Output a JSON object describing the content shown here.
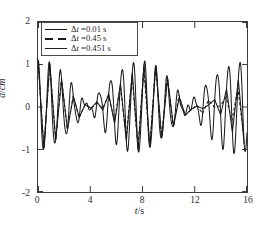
{
  "chart_data": {
    "type": "line",
    "title": "",
    "xlabel": "t/s",
    "ylabel": "d/cm",
    "xlim": [
      0,
      16
    ],
    "ylim": [
      -2,
      2
    ],
    "xticks": [
      "0",
      "4",
      "8",
      "12",
      "16"
    ],
    "xtick_values": [
      0,
      4,
      8,
      12,
      16
    ],
    "yticks": [
      "2",
      "1",
      "0",
      "-1",
      "-2"
    ],
    "ytick_values": [
      2,
      1,
      0,
      -1,
      -2
    ],
    "grid": false,
    "legend_position": "top-left",
    "series": [
      {
        "name": "Δt =0.01 s",
        "linestyle": "solid",
        "color": "#1a1a1a",
        "description": "Beating displacement signal, amplitude envelope ~1 cm, carrier period ~0.9 s"
      },
      {
        "name": "Δt =0.45 s",
        "linestyle": "dashed",
        "color": "#1a1a1a",
        "description": "Same signal sampled at 0.45 s, aliased waveform with slight phase shift"
      },
      {
        "name": "Δt =0.451 s",
        "linestyle": "solid",
        "color": "#1a1a1a",
        "description": "Same signal sampled at 0.451 s, aliased waveform nearly overlapping the 0.45 s trace"
      }
    ]
  },
  "axes": {
    "y_label": "d/cm",
    "y_label_var": "d",
    "y_label_unit": "/cm",
    "x_label_var": "t",
    "x_label_unit": "/s"
  },
  "legend": {
    "items": [
      {
        "label_delta": "Δ",
        "label_var": "t",
        "label_rest": " =0.01 s",
        "style": "solid"
      },
      {
        "label_delta": "Δ",
        "label_var": "t",
        "label_rest": " =0.45 s",
        "style": "dashed"
      },
      {
        "label_delta": "Δ",
        "label_var": "t",
        "label_rest": " =0.451 s",
        "style": "solid"
      }
    ]
  },
  "artifact": {
    "text": "· ·· ·· · ····· ············"
  }
}
